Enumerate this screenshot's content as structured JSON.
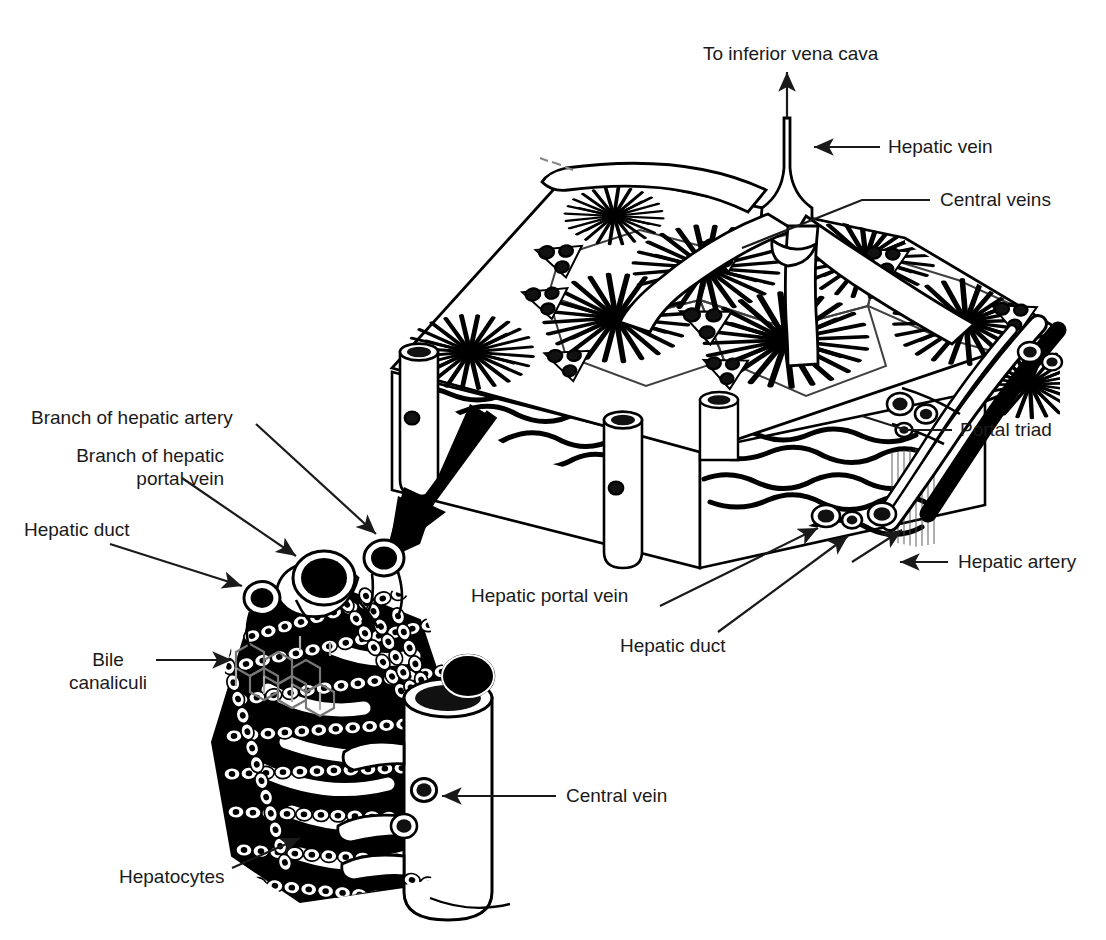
{
  "figure": {
    "kind": "anatomical-line-diagram",
    "style": "black-and-white line art",
    "background_color": "#ffffff",
    "ink_color": "#000000",
    "text_color": "#1a1a1a"
  },
  "labels": {
    "to_inferior_vena_cava": "To inferior vena cava",
    "hepatic_vein": "Hepatic vein",
    "central_veins": "Central veins",
    "portal_triad": "Portal triad",
    "hepatic_artery": "Hepatic artery",
    "hepatic_portal_vein": "Hepatic portal vein",
    "hepatic_duct_right": "Hepatic duct",
    "branch_of_hepatic_artery": "Branch of hepatic artery",
    "branch_of_hepatic_portal_vein_line1": "Branch of hepatic",
    "branch_of_hepatic_portal_vein_line2": "portal vein",
    "hepatic_duct_left": "Hepatic duct",
    "bile_line1": "Bile",
    "bile_line2": "canaliculi",
    "hepatocytes": "Hepatocytes",
    "central_vein": "Central vein"
  },
  "panels": {
    "upper": {
      "name": "liver-tissue-block",
      "description": "Cut-away 3D wedge of liver tissue showing several hepatic lobules in surface view, radiating sinusoids, central veins draining into the hepatic vein, and portal triads at the lobule corners.",
      "lobule_count": 6,
      "portal_triad_count": 9,
      "central_vein_cylinders_on_cut_face": 3
    },
    "lower": {
      "name": "lobule-detail",
      "description": "Magnified single lobule sector showing plates of hepatocytes, sinusoids, bile canaliculi network, the portal triad vessels and the central vein.",
      "hepatocyte_row_count": 8
    },
    "magnify_arrow": {
      "name": "magnification-arrow",
      "description": "Thick solid arrow pointing from the tissue block down-left to the magnified lobule detail."
    }
  }
}
